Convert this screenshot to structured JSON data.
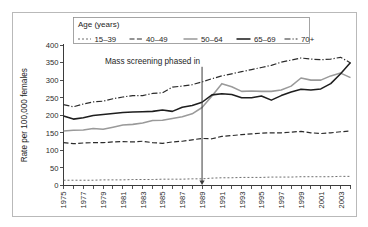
{
  "chart_data": {
    "type": "line",
    "title": "",
    "xlabel": "",
    "ylabel": "Rate per 100,000 females",
    "xlim": [
      1975,
      2004
    ],
    "ylim": [
      0,
      400
    ],
    "grid": false,
    "legend_position": "top",
    "legend_title": "Age (years)",
    "annotations": [
      {
        "text": "Mass screening phased in",
        "x": 1989,
        "y_text": 355,
        "arrow_to_y": 0,
        "style": "arrow-down"
      }
    ],
    "x": [
      1975,
      1976,
      1977,
      1978,
      1979,
      1980,
      1981,
      1982,
      1983,
      1984,
      1985,
      1986,
      1987,
      1988,
      1989,
      1990,
      1991,
      1992,
      1993,
      1994,
      1995,
      1996,
      1997,
      1998,
      1999,
      2000,
      2001,
      2002,
      2003,
      2004
    ],
    "xticks": [
      1975,
      1976,
      1977,
      1978,
      1979,
      1980,
      1981,
      1982,
      1983,
      1984,
      1985,
      1986,
      1987,
      1988,
      1989,
      1990,
      1991,
      1992,
      1993,
      1994,
      1995,
      1996,
      1997,
      1998,
      1999,
      2000,
      2001,
      2002,
      2003,
      2004
    ],
    "xticklabels": [
      "1975",
      "",
      "1977",
      "",
      "1979",
      "",
      "1981",
      "",
      "1983",
      "",
      "1985",
      "",
      "1987",
      "",
      "1989",
      "",
      "1991",
      "",
      "1993",
      "",
      "1995",
      "",
      "1997",
      "",
      "1999",
      "",
      "2001",
      "",
      "2003",
      ""
    ],
    "yticks": [
      0,
      50,
      100,
      150,
      200,
      250,
      300,
      350,
      400
    ],
    "yticklabels": [
      "0",
      "50",
      "100",
      "150",
      "200",
      "250",
      "300",
      "350",
      "400"
    ],
    "series": [
      {
        "name": "15–39",
        "label": "15–39",
        "dash": "2,2",
        "width": 1.0,
        "color": "#6e6e6e",
        "values": [
          15,
          15,
          15,
          15,
          16,
          16,
          16,
          17,
          17,
          17,
          18,
          18,
          18,
          19,
          19,
          21,
          22,
          22,
          23,
          23,
          23,
          24,
          24,
          24,
          25,
          25,
          25,
          25,
          26,
          26
        ]
      },
      {
        "name": "40–49",
        "label": "40–49",
        "dash": "5,2.4",
        "width": 1.2,
        "color": "#2b2b2b",
        "values": [
          122,
          119,
          121,
          122,
          122,
          124,
          125,
          124,
          126,
          122,
          120,
          124,
          126,
          130,
          134,
          133,
          140,
          142,
          145,
          147,
          149,
          150,
          150,
          152,
          154,
          150,
          148,
          150,
          153,
          155
        ]
      },
      {
        "name": "50–64",
        "label": "50–64",
        "dash": "none",
        "width": 1.55,
        "color": "#9a9a9a",
        "values": [
          155,
          157,
          158,
          162,
          160,
          166,
          172,
          174,
          178,
          185,
          186,
          191,
          196,
          204,
          222,
          255,
          290,
          281,
          268,
          269,
          268,
          268,
          272,
          283,
          306,
          300,
          300,
          312,
          320,
          307
        ]
      },
      {
        "name": "65–69",
        "label": "65–69",
        "dash": "none",
        "width": 1.55,
        "color": "#1e1e1e",
        "values": [
          198,
          189,
          193,
          199,
          202,
          205,
          208,
          209,
          210,
          211,
          215,
          211,
          223,
          228,
          237,
          258,
          261,
          259,
          250,
          250,
          255,
          243,
          256,
          266,
          274,
          272,
          275,
          290,
          318,
          350
        ]
      },
      {
        "name": "70+",
        "label": "70+",
        "dash": "6,2,1.2,2",
        "width": 1.2,
        "color": "#2b2b2b",
        "values": [
          230,
          224,
          232,
          238,
          240,
          247,
          252,
          256,
          256,
          262,
          264,
          280,
          283,
          287,
          295,
          304,
          312,
          318,
          324,
          330,
          336,
          342,
          351,
          357,
          363,
          360,
          358,
          360,
          365,
          349
        ]
      }
    ]
  },
  "legend": {
    "title": "Age (years)",
    "items": [
      {
        "label": "15–39"
      },
      {
        "label": "40–49"
      },
      {
        "label": "50–64"
      },
      {
        "label": "65–69"
      },
      {
        "label": "70+"
      }
    ]
  },
  "axes": {
    "y_title": "Rate per 100,000 females"
  },
  "annotation": {
    "text": "Mass screening phased in"
  }
}
